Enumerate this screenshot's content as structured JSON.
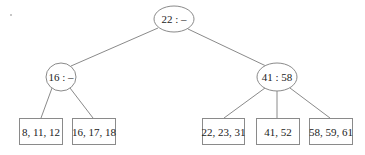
{
  "diagram": {
    "type": "b-tree",
    "colors": {
      "stroke": "#8a8a8a",
      "text": "#222222",
      "background": "#ffffff"
    },
    "root": {
      "label": "22 : –"
    },
    "internal": [
      {
        "label": "16 : –"
      },
      {
        "label": "41 : 58"
      }
    ],
    "leaves": [
      {
        "label": "8, 11, 12"
      },
      {
        "label": "16, 17, 18"
      },
      {
        "label": "22, 23, 31"
      },
      {
        "label": "41, 52"
      },
      {
        "label": "58, 59, 61"
      }
    ]
  }
}
